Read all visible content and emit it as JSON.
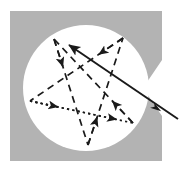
{
  "figure": {
    "canvas": {
      "width": 190,
      "height": 172,
      "background": "#ffffff"
    },
    "colors": {
      "background": "#ffffff",
      "square_fill": "#b3b3b3",
      "circle_fill": "#ffffff",
      "stroke": "#1a1a1a"
    },
    "square": {
      "name": "gray-square",
      "x": 10,
      "y": 11,
      "width": 152,
      "height": 150,
      "fill": "#b3b3b3",
      "notch": {
        "name": "right-edge-notch",
        "description": "concave wedge cut into the right edge",
        "points": "162,60 143,88 162,116"
      }
    },
    "circle": {
      "name": "white-circle",
      "cx": 86,
      "cy": 88,
      "r": 63,
      "fill": "#ffffff"
    },
    "vertices": [
      {
        "id": "A",
        "label": "top-left-vertex",
        "x": 54,
        "y": 39
      },
      {
        "id": "B",
        "label": "top-right-vertex",
        "x": 123,
        "y": 38
      },
      {
        "id": "C",
        "label": "left-vertex",
        "x": 30,
        "y": 101
      },
      {
        "id": "D",
        "label": "right-vertex",
        "x": 133,
        "y": 123
      },
      {
        "id": "E",
        "label": "bottom-vertex",
        "x": 88,
        "y": 145
      }
    ],
    "edges": [
      {
        "id": "e1",
        "name": "edge-A-to-E",
        "style": "dashed",
        "from": "A",
        "to": "E",
        "arrow_at": "mid-forward"
      },
      {
        "id": "e2",
        "name": "edge-E-to-B",
        "style": "dashed",
        "from": "E",
        "to": "B",
        "arrow_at": "mid-forward"
      },
      {
        "id": "e3",
        "name": "edge-B-to-C",
        "style": "dashed",
        "from": "B",
        "to": "C",
        "arrow_at": "mid-forward"
      },
      {
        "id": "e4",
        "name": "edge-C-to-D",
        "style": "dotted",
        "from": "C",
        "to": "D",
        "arrow_at": "mid-forward"
      },
      {
        "id": "e5",
        "name": "edge-D-to-A",
        "style": "dashed",
        "from": "D",
        "to": "A",
        "arrow_at": "mid-forward"
      }
    ],
    "solid_line": {
      "name": "solid-double-arrow-line",
      "style": "solid",
      "from": {
        "x": 178,
        "y": 119
      },
      "to": {
        "x": 69,
        "y": 45
      },
      "arrowheads": [
        "head-at-upper-left-end",
        "mid-arrow-pointing-lower-right"
      ],
      "mid_arrow_at": {
        "x": 152,
        "y": 105
      }
    },
    "stroke_widths": {
      "dashed": 1.7,
      "dotted": 1.7,
      "solid": 2.0
    },
    "dash_patterns": {
      "dashed": "7,5",
      "dotted": "2.2,3.2"
    }
  }
}
